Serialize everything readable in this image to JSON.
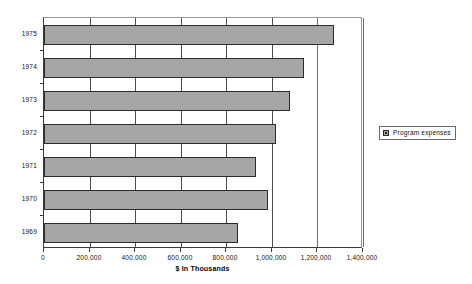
{
  "chart_data": {
    "type": "bar",
    "orientation": "horizontal",
    "title": "",
    "xlabel": "$ In Thousands",
    "ylabel": "",
    "categories": [
      "1975",
      "1974",
      "1973",
      "1972",
      "1971",
      "1970",
      "1969"
    ],
    "series": [
      {
        "name": "Program expenses",
        "values": [
          1274000,
          1143000,
          1080000,
          1019000,
          929000,
          983000,
          852000
        ]
      }
    ],
    "xlim": [
      0,
      1400000
    ],
    "xticks": [
      0,
      200000,
      400000,
      600000,
      800000,
      1000000,
      1200000,
      1400000
    ],
    "xtick_labels": [
      "0",
      "200,000",
      "400,000",
      "600,000",
      "800,000",
      "1,000,000",
      "1,200,000",
      "1,400,000"
    ],
    "ytick_labels": [
      "1975",
      "1974",
      "1973",
      "1972",
      "1971",
      "1970",
      "1969"
    ],
    "grid": true,
    "grid_axis": "x",
    "legend_position": "right",
    "legend_entries": [
      "Program expenses"
    ],
    "bar_color": "#a6a6a6",
    "bar_border_color": "#2b2b2b",
    "background_color": "#ffffff"
  },
  "legend": {
    "label": "Program expenses",
    "swatch_name": "legend-swatch"
  },
  "axis": {
    "x_title": "$ In Thousands"
  }
}
